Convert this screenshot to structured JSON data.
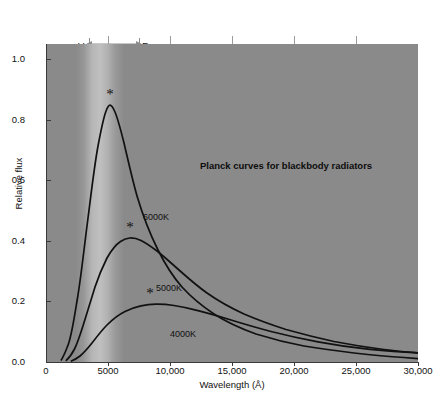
{
  "chart_data": {
    "type": "line",
    "title": "Planck curves for blackbody radiators",
    "xlabel": "Wavelength (Å)",
    "ylabel": "Relative flux",
    "xlim": [
      0,
      30000
    ],
    "ylim": [
      0.0,
      1.05
    ],
    "xticks": [
      "0",
      "5000",
      "10,000",
      "15,000",
      "20,000",
      "25,000",
      "30,000"
    ],
    "xtick_values": [
      0,
      5000,
      10000,
      15000,
      20000,
      25000,
      30000
    ],
    "yticks": [
      "0.0",
      "0.2",
      "0.4",
      "0.6",
      "0.8",
      "1.0"
    ],
    "ytick_values": [
      0.0,
      0.2,
      0.4,
      0.6,
      0.8,
      1.0
    ],
    "grid": false,
    "legend": "inline-curve-labels",
    "series": [
      {
        "name": "6000K",
        "label": "6000K",
        "peak_wavelength": 4830,
        "peak_flux": 1.0,
        "peak_marker": "asterisk",
        "x": [
          1200,
          1800,
          2300,
          2800,
          3300,
          3800,
          4300,
          4830,
          5400,
          6000,
          7000,
          8000,
          9500,
          11000,
          13000,
          15000,
          18000,
          21000,
          25000,
          30000
        ],
        "y": [
          0.005,
          0.05,
          0.17,
          0.38,
          0.62,
          0.83,
          0.96,
          1.0,
          0.96,
          0.88,
          0.71,
          0.56,
          0.39,
          0.28,
          0.19,
          0.13,
          0.082,
          0.056,
          0.035,
          0.02
        ]
      },
      {
        "name": "5000K",
        "label": "5000K",
        "peak_wavelength": 5800,
        "peak_flux": 0.4,
        "peak_marker": "asterisk",
        "x": [
          1600,
          2300,
          2900,
          3500,
          4100,
          4700,
          5200,
          5800,
          6500,
          7200,
          8200,
          9500,
          11000,
          13000,
          15000,
          18000,
          21000,
          25000,
          30000
        ],
        "y": [
          0.004,
          0.03,
          0.09,
          0.18,
          0.27,
          0.345,
          0.385,
          0.4,
          0.392,
          0.37,
          0.325,
          0.265,
          0.21,
          0.155,
          0.118,
          0.082,
          0.06,
          0.04,
          0.026
        ]
      },
      {
        "name": "4000K",
        "label": "4000K",
        "peak_wavelength": 7250,
        "peak_flux": 0.135,
        "peak_marker": "asterisk",
        "x": [
          2000,
          2900,
          3700,
          4500,
          5300,
          6100,
          6800,
          7250,
          8000,
          9000,
          10500,
          12000,
          14000,
          16500,
          19000,
          22000,
          26000,
          30000
        ],
        "y": [
          0.002,
          0.015,
          0.042,
          0.075,
          0.103,
          0.122,
          0.132,
          0.135,
          0.133,
          0.127,
          0.114,
          0.1,
          0.083,
          0.066,
          0.053,
          0.041,
          0.03,
          0.023
        ]
      }
    ],
    "annotations": [
      {
        "name": "filter-band",
        "left_label": "V",
        "right_label": "R",
        "left_wavelength": 3500,
        "right_wavelength": 7500,
        "arrow": "double-headed"
      }
    ]
  },
  "axes": {
    "ylabel": "Relative flux",
    "xlabel": "Wavelength (Å)"
  },
  "colors": {
    "plot_background": "#8a8a8a",
    "page_background": "#ffffff",
    "curve": "#111111",
    "axis": "#3a3a3a",
    "text": "#111111"
  }
}
